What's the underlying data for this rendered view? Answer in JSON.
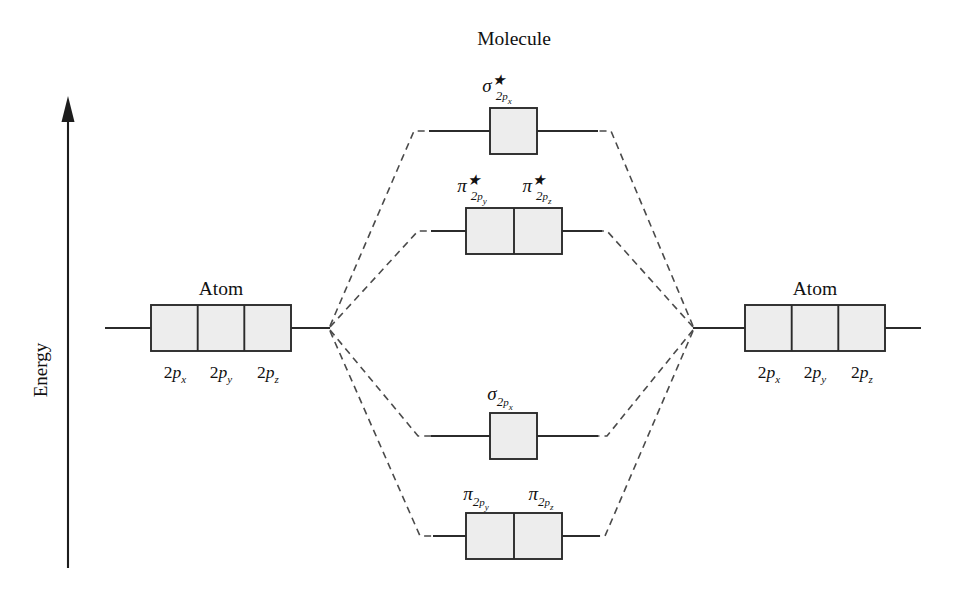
{
  "figure": {
    "type": "molecular-orbital-energy-diagram",
    "axis": {
      "label": "Energy",
      "direction": "up",
      "arrow_icon": "up-arrow-icon"
    },
    "columns": {
      "left_atom_title": "Atom",
      "molecule_title": "Molecule",
      "right_atom_title": "Atom"
    },
    "atomic_orbitals": [
      {
        "label": "2p",
        "sub": "x",
        "full": "2p_x"
      },
      {
        "label": "2p",
        "sub": "y",
        "full": "2p_y"
      },
      {
        "label": "2p",
        "sub": "z",
        "full": "2p_z"
      }
    ],
    "molecular_levels": [
      {
        "id": "sigma-star-2px",
        "symbol": "σ",
        "star": "★",
        "antibonding": true,
        "sub_num": "2",
        "sub_orb": "p",
        "sub_axis": "x",
        "boxes": 1,
        "full": "σ*_2p_x"
      },
      {
        "id": "pi-star-2py-2pz",
        "symbol": "π",
        "star": "★",
        "antibonding": true,
        "sub_num": "2",
        "sub_orb": "p",
        "sub_axis": "y",
        "sub_axis2": "z",
        "boxes": 2,
        "full": "π*_2p_y , π*_2p_z"
      },
      {
        "id": "sigma-2px",
        "symbol": "σ",
        "star": "",
        "antibonding": false,
        "sub_num": "2",
        "sub_orb": "p",
        "sub_axis": "x",
        "boxes": 1,
        "full": "σ_2p_x"
      },
      {
        "id": "pi-2py-2pz",
        "symbol": "π",
        "star": "",
        "antibonding": false,
        "sub_num": "2",
        "sub_orb": "p",
        "sub_axis": "y",
        "sub_axis2": "z",
        "boxes": 2,
        "full": "π_2p_y , π_2p_z"
      }
    ],
    "colors": {
      "box_fill": "#ededed",
      "stroke": "#2b2b2b",
      "dashed": "#4a4a4a",
      "background": "#ffffff"
    }
  }
}
